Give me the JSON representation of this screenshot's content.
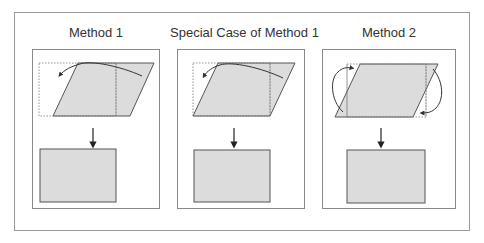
{
  "figure": {
    "panels": [
      {
        "id": "method-1",
        "title": "Method 1"
      },
      {
        "id": "special-case-method-1",
        "title": "Special Case of Method 1"
      },
      {
        "id": "method-2",
        "title": "Method 2"
      }
    ],
    "colors": {
      "shape_fill": "#dcdcdc",
      "shape_stroke": "#555555",
      "dashed_stroke": "#777777",
      "frame_stroke": "#9a9a9a",
      "arrow": "#222222",
      "curve": "#333333"
    }
  }
}
